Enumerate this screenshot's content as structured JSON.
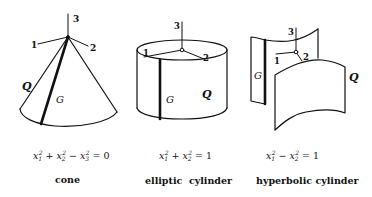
{
  "figure": {
    "panels": [
      {
        "name": "cone",
        "caption": "cone",
        "equation": {
          "terms": [
            "x",
            "1",
            "2",
            "+",
            "x",
            "2",
            "2",
            "−",
            "x",
            "3",
            "2"
          ],
          "text": "x₁² + x₂² − x₃² = 0",
          "lhs_1": "x",
          "sub_1": "1",
          "sup_1": "2",
          "op_1": "+",
          "lhs_2": "x",
          "sub_2": "2",
          "sup_2": "2",
          "op_2": "−",
          "lhs_3": "x",
          "sub_3": "3",
          "sup_3": "2",
          "rhs": "= 0"
        },
        "axis_labels": {
          "a1": "1",
          "a2": "2",
          "a3": "3"
        },
        "surface_label": "Q",
        "generator_label": "G"
      },
      {
        "name": "elliptic-cylinder",
        "caption": "elliptic  cylinder",
        "equation": {
          "text": "x₁² + x₂² = 1",
          "lhs_1": "x",
          "sub_1": "1",
          "sup_1": "2",
          "op_1": "+",
          "lhs_2": "x",
          "sub_2": "2",
          "sup_2": "2",
          "rhs": "= 1"
        },
        "axis_labels": {
          "a1": "1",
          "a2": "2",
          "a3": "3"
        },
        "surface_label": "Q",
        "generator_label": "G"
      },
      {
        "name": "hyperbolic-cylinder",
        "caption": "hyperbolic cylinder",
        "equation": {
          "text": "x₁² − x₂² = 1",
          "lhs_1": "x",
          "sub_1": "1",
          "sup_1": "2",
          "op_1": "−",
          "lhs_2": "x",
          "sub_2": "2",
          "sup_2": "2",
          "rhs": "= 1"
        },
        "axis_labels": {
          "a1": "1",
          "a2": "2",
          "a3": "3"
        },
        "surface_label": "Q",
        "generator_label": "G"
      }
    ]
  }
}
